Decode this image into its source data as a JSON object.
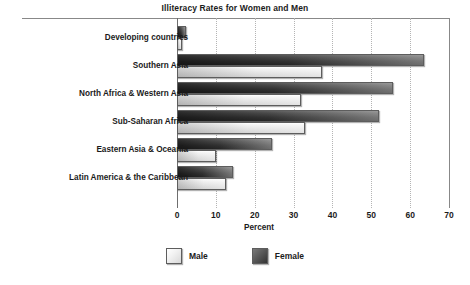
{
  "chart_data": {
    "type": "bar",
    "orientation": "horizontal",
    "title": "Illiteracy Rates for Women and Men",
    "xlabel": "Percent",
    "ylabel": "",
    "xlim": [
      0,
      70
    ],
    "xticks": [
      "0",
      "10",
      "20",
      "30",
      "40",
      "50",
      "60",
      "70"
    ],
    "grid": "vertical-dotted",
    "legend_position": "bottom-center",
    "categories": [
      "Developing countries",
      "Southern Asia",
      "North Africa & Western Asia",
      "Sub-Saharan Africa",
      "Eastern Asia & Oceania",
      "Latin America & the Caribbean"
    ],
    "series": [
      {
        "name": "Male",
        "color": "#e0e0e0",
        "values": [
          1.2,
          37.3,
          32.0,
          33.0,
          10.0,
          12.5
        ]
      },
      {
        "name": "Female",
        "color": "#3d3d3d",
        "values": [
          2.2,
          63.5,
          55.5,
          52.0,
          24.5,
          14.5
        ]
      }
    ]
  },
  "legend": {
    "items": [
      {
        "label": "Male",
        "swatch": "male-swatch-icon"
      },
      {
        "label": "Female",
        "swatch": "female-swatch-icon"
      }
    ]
  },
  "colors": {
    "axis": "#6e6e6e",
    "frame": "#888888",
    "gridline": "#b4b4b4",
    "text": "#1b1b1b",
    "background": "#ffffff"
  }
}
